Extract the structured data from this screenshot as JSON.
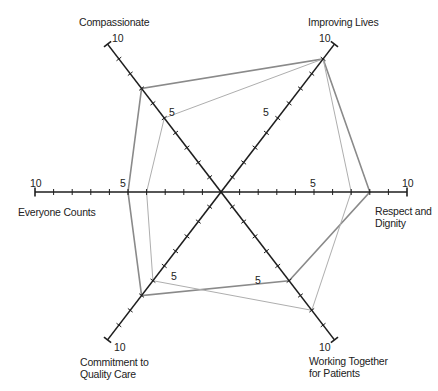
{
  "chart_data": {
    "type": "radar",
    "title": "",
    "scale": {
      "min": 0,
      "max": 10,
      "major_tick_label": [
        5,
        10
      ],
      "ticks_every": 1
    },
    "axes": [
      {
        "key": "improving",
        "label": "Improving Lives",
        "lines": [
          "Improving Lives"
        ]
      },
      {
        "key": "respect",
        "label": "Respect and Dignity",
        "lines": [
          "Respect and",
          "Dignity"
        ]
      },
      {
        "key": "working",
        "label": "Working Together for Patients",
        "lines": [
          "Working Together",
          "for Patients"
        ]
      },
      {
        "key": "commitment",
        "label": "Commitment to Quality Care",
        "lines": [
          "Commitment to",
          "Quality Care"
        ]
      },
      {
        "key": "everyone",
        "label": "Everyone Counts",
        "lines": [
          "Everyone Counts"
        ]
      },
      {
        "key": "compassionate",
        "label": "Compassionate",
        "lines": [
          "Compassionate"
        ]
      }
    ],
    "series": [
      {
        "name": "Series A (dark)",
        "color": "#8a8a8a",
        "width": 1.6,
        "values": [
          9,
          8,
          6,
          7,
          5,
          7
        ]
      },
      {
        "name": "Series B (light)",
        "color": "#aeaeae",
        "width": 1.0,
        "values": [
          9,
          7,
          8,
          6,
          4,
          5
        ]
      }
    ],
    "legend": null,
    "grid": false
  },
  "labels": {
    "compassionate": "Compassionate",
    "improving": "Improving Lives",
    "everyone": "Everyone Counts",
    "respect_1": "Respect and",
    "respect_2": "Dignity",
    "working_1": "Working Together",
    "working_2": "for Patients",
    "commitment_1": "Commitment to",
    "commitment_2": "Quality Care"
  },
  "tick_labels": {
    "five": "5",
    "ten": "10"
  },
  "colors": {
    "axis": "#1e1e1e",
    "text": "#222222"
  }
}
